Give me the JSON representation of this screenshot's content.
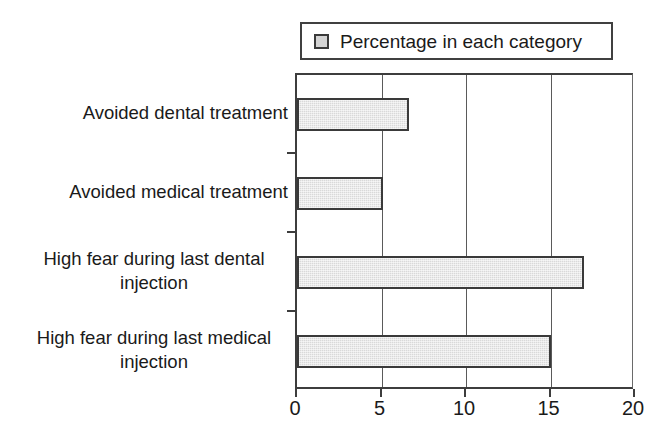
{
  "chart_data": {
    "type": "bar",
    "orientation": "horizontal",
    "title": "",
    "xlabel": "",
    "ylabel": "",
    "categories": [
      "Avoided dental treatment",
      "Avoided medical treatment",
      "High fear during last dental injection",
      "High fear during last medical injection"
    ],
    "category_lines": [
      [
        "Avoided dental treatment"
      ],
      [
        "Avoided medical treatment"
      ],
      [
        "High fear during last dental",
        "injection"
      ],
      [
        "High fear during last medical",
        "injection"
      ]
    ],
    "values": [
      6.6,
      5.1,
      17.0,
      15.0
    ],
    "series": [
      {
        "name": "Percentage in each category",
        "values": [
          6.6,
          5.1,
          17.0,
          15.0
        ]
      }
    ],
    "xlim": [
      0,
      20
    ],
    "xticks": [
      0,
      5,
      10,
      15,
      20
    ],
    "xtick_labels": [
      "0",
      "5",
      "10",
      "15",
      "20"
    ],
    "grid": "vertical",
    "legend": {
      "position": "top",
      "entries": [
        "Percentage in each category"
      ]
    },
    "colors": {
      "bar_fill": "#d9d9d9",
      "bar_border": "#3a3a3a",
      "axis": "#3d3d3d",
      "grid": "#5a5a5a",
      "text": "#1a1a1a",
      "background": "#ffffff"
    }
  },
  "legend": {
    "label": "Percentage in each category",
    "swatch_icon": "legend-square-icon"
  },
  "axis": {
    "x_labels": [
      "0",
      "5",
      "10",
      "15",
      "20"
    ]
  }
}
